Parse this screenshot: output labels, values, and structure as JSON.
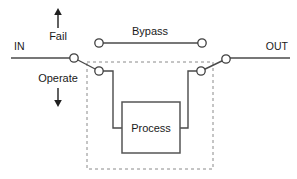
{
  "diagram": {
    "title_labels": {
      "input": "IN",
      "output": "OUT",
      "bypass": "Bypass",
      "fail": "Fail",
      "operate": "Operate",
      "process": "Process"
    },
    "colors": {
      "wire": "#4a4a4a",
      "terminal_stroke": "#3f3f3f",
      "terminal_fill": "#ffffff",
      "box_stroke": "#555555",
      "dashed_stroke": "#8a8a8a",
      "arrow": "#1f1f1f",
      "text": "#1a1a1a",
      "background": "#ffffff"
    },
    "nodes": [
      {
        "name": "left-switch-pivot",
        "x": 74,
        "y": 58,
        "r": 4.2
      },
      {
        "name": "left-switch-contact",
        "x": 99,
        "y": 71,
        "r": 4.2
      },
      {
        "name": "bypass-left-terminal",
        "x": 99,
        "y": 43,
        "r": 4.2
      },
      {
        "name": "bypass-right-terminal",
        "x": 202,
        "y": 43,
        "r": 4.2
      },
      {
        "name": "right-switch-contact",
        "x": 201,
        "y": 71,
        "r": 4.2
      },
      {
        "name": "right-switch-pivot",
        "x": 226,
        "y": 59,
        "r": 4.2
      }
    ],
    "process_box": {
      "x": 122,
      "y": 102,
      "width": 58,
      "height": 51
    },
    "dashed_region": {
      "x": 87,
      "y": 62,
      "width": 126,
      "height": 107
    },
    "arrows": [
      {
        "name": "fail-arrow",
        "direction": "up",
        "x": 58,
        "y_start": 28,
        "y_end": 9
      },
      {
        "name": "operate-arrow",
        "direction": "down",
        "x": 58,
        "y_start": 88,
        "y_end": 106
      }
    ]
  }
}
